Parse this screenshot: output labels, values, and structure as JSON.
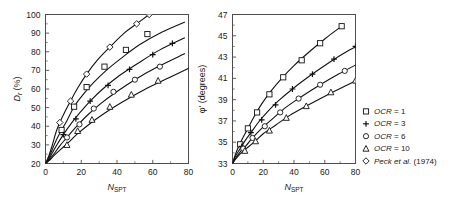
{
  "figure": {
    "background": "#ffffff",
    "line_color": "#111111",
    "axis_color": "#4d4d4d"
  },
  "legend": {
    "position": "right",
    "entries": [
      {
        "marker": "square-marker",
        "label_italic": "OCR",
        "label_rest": " = 1"
      },
      {
        "marker": "plus-marker",
        "label_italic": "OCR",
        "label_rest": " = 3"
      },
      {
        "marker": "circle-marker",
        "label_italic": "OCR",
        "label_rest": " = 6"
      },
      {
        "marker": "triangle-marker",
        "label_italic": "OCR",
        "label_rest": " = 10"
      },
      {
        "marker": "diamond-marker",
        "label_italic": "Peck et al.",
        "label_rest": " (1974)"
      }
    ]
  },
  "chart_data": [
    {
      "type": "line",
      "id": "relative-density-chart",
      "title": "",
      "xlabel_main": "N",
      "xlabel_sub": "SPT",
      "ylabel": "D",
      "ylabel_sub": "r",
      "ylabel_unit": " (%)",
      "xlim": [
        0,
        80
      ],
      "ylim": [
        20,
        100
      ],
      "xticks": [
        0,
        20,
        40,
        60,
        80
      ],
      "yticks": [
        20,
        30,
        40,
        50,
        60,
        70,
        80,
        90,
        100
      ],
      "xminor_step": 10,
      "yminor_step": 5,
      "grid": false,
      "series": [
        {
          "name": "Peck et al. (1974)",
          "marker": "diamond-marker",
          "x": [
            0,
            2,
            4,
            6,
            8,
            11,
            14,
            18,
            23,
            29,
            36,
            44,
            51,
            58
          ],
          "y": [
            20,
            24.5,
            30.5,
            37.2,
            42.0,
            48.0,
            53.5,
            60.5,
            68.0,
            75.5,
            82.5,
            90.0,
            95.0,
            100.0
          ],
          "marker_x": [
            8,
            14,
            23,
            36,
            51,
            58
          ],
          "marker_y": [
            42.0,
            53.5,
            68.0,
            82.5,
            95.0,
            100.0
          ]
        },
        {
          "name": "OCR = 1",
          "marker": "square-marker",
          "x": [
            0,
            2,
            4,
            6,
            9,
            12,
            16,
            21,
            27,
            34,
            43,
            53,
            65,
            78
          ],
          "y": [
            20,
            23.5,
            28.0,
            32.5,
            38.0,
            43.0,
            50.5,
            57.0,
            63.5,
            70.0,
            77.0,
            84.0,
            90.5,
            96.0
          ],
          "marker_x": [
            9,
            16,
            23,
            33,
            45,
            57
          ],
          "marker_y": [
            38.0,
            50.5,
            61.0,
            72.0,
            81.0,
            89.5
          ]
        },
        {
          "name": "OCR = 3",
          "marker": "plus-marker",
          "x": [
            0,
            2,
            4,
            7,
            10,
            14,
            19,
            25,
            32,
            41,
            52,
            64,
            78
          ],
          "y": [
            20,
            22.5,
            26.0,
            31.0,
            35.5,
            41.0,
            47.0,
            53.5,
            60.0,
            67.0,
            74.0,
            81.0,
            87.5
          ],
          "marker_x": [
            10,
            17,
            25,
            35,
            47,
            60,
            71
          ],
          "marker_y": [
            35.5,
            44.0,
            53.5,
            62.0,
            70.5,
            78.5,
            84.5
          ]
        },
        {
          "name": "OCR = 6",
          "marker": "circle-marker",
          "x": [
            0,
            2,
            5,
            8,
            12,
            17,
            23,
            30,
            39,
            50,
            62,
            78
          ],
          "y": [
            20,
            22.0,
            25.5,
            29.5,
            34.0,
            39.5,
            45.5,
            51.5,
            58.0,
            65.0,
            71.5,
            79.0
          ],
          "marker_x": [
            12,
            19,
            27,
            38,
            50,
            64
          ],
          "marker_y": [
            34.0,
            41.0,
            49.5,
            58.5,
            65.0,
            72.0
          ]
        },
        {
          "name": "OCR = 10",
          "marker": "triangle-marker",
          "x": [
            0,
            2,
            5,
            9,
            13,
            18,
            25,
            33,
            43,
            55,
            69,
            82
          ],
          "y": [
            20,
            21.5,
            24.5,
            28.0,
            31.5,
            36.0,
            41.5,
            47.0,
            53.0,
            59.5,
            66.0,
            72.0
          ],
          "marker_x": [
            12,
            18,
            26,
            36,
            48,
            63
          ],
          "marker_y": [
            30.0,
            37.5,
            43.5,
            50.5,
            57.0,
            64.5
          ]
        }
      ]
    },
    {
      "type": "line",
      "id": "friction-angle-chart",
      "title": "",
      "xlabel_main": "N",
      "xlabel_sub": "SPT",
      "ylabel": "φ' (degrees)",
      "xlim": [
        0,
        80
      ],
      "ylim": [
        33,
        47
      ],
      "xticks": [
        0,
        20,
        40,
        60,
        80
      ],
      "yticks": [
        33,
        35,
        37,
        39,
        41,
        43,
        45,
        47
      ],
      "xminor_step": 10,
      "yminor_step": 1,
      "grid": false,
      "series": [
        {
          "name": "OCR = 1",
          "marker": "square-marker",
          "x": [
            0,
            2,
            4,
            7,
            10,
            14,
            19,
            25,
            32,
            40,
            50,
            60,
            71
          ],
          "y": [
            33.0,
            33.9,
            34.6,
            35.5,
            36.3,
            37.4,
            38.6,
            39.8,
            41.0,
            42.2,
            43.5,
            44.7,
            45.9
          ],
          "marker_x": [
            5,
            10,
            16,
            24,
            33,
            45,
            57,
            71
          ],
          "marker_y": [
            34.8,
            36.3,
            37.8,
            39.5,
            41.1,
            42.7,
            44.3,
            45.9
          ]
        },
        {
          "name": "OCR = 3",
          "marker": "plus-marker",
          "x": [
            0,
            2,
            5,
            8,
            12,
            17,
            23,
            30,
            39,
            49,
            61,
            73,
            82
          ],
          "y": [
            33.0,
            33.7,
            34.4,
            35.1,
            35.9,
            36.9,
            37.9,
            38.9,
            40.0,
            41.1,
            42.3,
            43.4,
            44.1
          ],
          "marker_x": [
            6,
            12,
            19,
            28,
            39,
            52,
            66,
            80
          ],
          "marker_y": [
            34.6,
            35.9,
            37.1,
            38.5,
            40.0,
            41.4,
            42.8,
            44.0
          ]
        },
        {
          "name": "OCR = 6",
          "marker": "circle-marker",
          "x": [
            0,
            2,
            5,
            9,
            13,
            19,
            26,
            34,
            44,
            56,
            69,
            82
          ],
          "y": [
            33.0,
            33.5,
            34.1,
            34.7,
            35.4,
            36.3,
            37.2,
            38.2,
            39.2,
            40.3,
            41.4,
            42.4
          ],
          "marker_x": [
            7,
            13,
            21,
            31,
            43,
            57,
            73
          ],
          "marker_y": [
            34.4,
            35.4,
            36.5,
            37.8,
            39.1,
            40.4,
            41.7
          ]
        },
        {
          "name": "OCR = 10",
          "marker": "triangle-marker",
          "x": [
            0,
            2,
            5,
            9,
            14,
            20,
            28,
            37,
            48,
            61,
            75,
            82
          ],
          "y": [
            33.0,
            33.4,
            33.9,
            34.4,
            35.0,
            35.8,
            36.6,
            37.5,
            38.4,
            39.4,
            40.4,
            40.9
          ],
          "marker_x": [
            8,
            15,
            24,
            35,
            48,
            64,
            80
          ],
          "marker_y": [
            34.2,
            35.1,
            36.1,
            37.3,
            38.4,
            39.7,
            40.8
          ]
        }
      ]
    }
  ]
}
